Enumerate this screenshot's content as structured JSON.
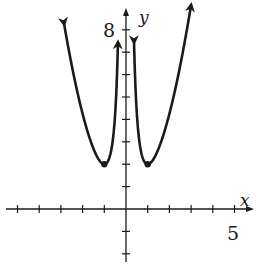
{
  "chart_data": {
    "type": "line",
    "title": "",
    "xlabel": "x",
    "ylabel": "y",
    "xlim": [
      -5,
      5
    ],
    "ylim": [
      -2,
      8
    ],
    "x_tick_step": 1,
    "y_tick_step": 1,
    "x_tick_labels": [
      {
        "value": 5,
        "label": "5"
      }
    ],
    "y_tick_labels": [
      {
        "value": 8,
        "label": "8"
      }
    ],
    "grid": false,
    "legend": null,
    "function": "y = x^2 + 1/x^2",
    "series": [
      {
        "name": "left branch",
        "x": [
          -2.85,
          -2.5,
          -2.0,
          -1.5,
          -1.0,
          -0.75,
          -0.6,
          -0.5,
          -0.42,
          -0.37
        ],
        "y": [
          8.25,
          6.41,
          4.25,
          2.69,
          2.0,
          2.34,
          3.14,
          4.25,
          5.85,
          7.44
        ],
        "arrows": "both"
      },
      {
        "name": "right branch",
        "x": [
          0.37,
          0.42,
          0.5,
          0.6,
          0.75,
          1.0,
          1.5,
          2.0,
          2.5,
          3.0
        ],
        "y": [
          7.44,
          5.85,
          4.25,
          3.14,
          2.34,
          2.0,
          2.69,
          4.25,
          6.41,
          9.11
        ],
        "arrows": "both"
      }
    ],
    "points": [
      {
        "x": -1,
        "y": 2,
        "label": ""
      },
      {
        "x": 1,
        "y": 2,
        "label": ""
      }
    ],
    "colors": {
      "curve": "#1a1a1a",
      "axes": "#1a1a1a",
      "background": "#ffffff"
    }
  },
  "labels": {
    "x_axis": "x",
    "y_axis": "y",
    "x_max": "5",
    "y_max": "8"
  }
}
